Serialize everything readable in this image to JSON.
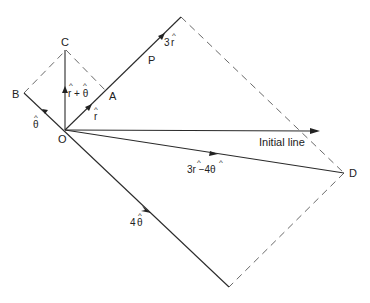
{
  "points": {
    "O": "O",
    "A": "A",
    "B": "B",
    "C": "C",
    "D": "D",
    "P": "P"
  },
  "vectors": {
    "r_hat": {
      "coef": "",
      "symbol": "r"
    },
    "theta_hat": {
      "coef": "",
      "symbol": "θ"
    },
    "r_plus_theta": {
      "text": "r + θ"
    },
    "three_r": {
      "coef": "3",
      "symbol": "r"
    },
    "four_theta": {
      "coef": "4",
      "symbol": "θ"
    },
    "three_r_minus_four_theta": {
      "text": "3r −4θ"
    }
  },
  "hat_glyph": "^",
  "initial_line_label": "Initial line"
}
